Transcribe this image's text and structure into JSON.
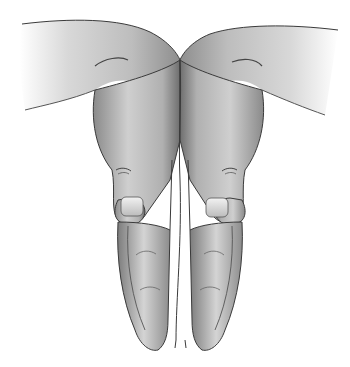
{
  "image": {
    "subject": "two-hands-pressed-together-illustration",
    "style": "grayscale",
    "background": "#ffffff",
    "colors": {
      "skin_light": "#e6e6e6",
      "skin_mid": "#b8b8b8",
      "skin_dark": "#7a7a7a",
      "outline": "#3a3a3a",
      "nail": "#d9d9d9"
    }
  }
}
